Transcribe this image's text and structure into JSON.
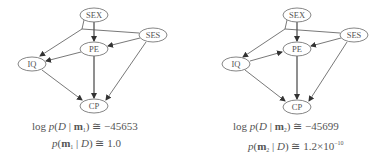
{
  "diagrams": [
    {
      "id": "m1",
      "nodes": {
        "sex": {
          "label": "SEX",
          "cx": 94,
          "cy": 15,
          "rx": 14,
          "ry": 7
        },
        "ses": {
          "label": "SES",
          "cx": 153,
          "cy": 35,
          "rx": 14,
          "ry": 7
        },
        "pe": {
          "label": "PE",
          "cx": 94,
          "cy": 49,
          "rx": 14,
          "ry": 7
        },
        "iq": {
          "label": "IQ",
          "cx": 32,
          "cy": 64,
          "rx": 14,
          "ry": 7
        },
        "cp": {
          "label": "CP",
          "cx": 94,
          "cy": 106,
          "rx": 14,
          "ry": 7
        }
      },
      "edges": [
        {
          "from": "SEX",
          "to": "PE"
        },
        {
          "from": "SES",
          "to": "PE"
        },
        {
          "from": "SEX",
          "to": "IQ"
        },
        {
          "from": "SES",
          "to": "IQ"
        },
        {
          "from": "PE",
          "to": "IQ"
        },
        {
          "from": "IQ",
          "to": "CP"
        },
        {
          "from": "PE",
          "to": "CP"
        },
        {
          "from": "SES",
          "to": "CP"
        }
      ],
      "formula": {
        "log_prefix": "log",
        "p": "p",
        "D": "D",
        "m": "m",
        "subscript": "1",
        "approx": "≅",
        "log_likelihood": "−45653",
        "posterior": "1.0",
        "posterior_exp": ""
      }
    },
    {
      "id": "m2",
      "nodes": {
        "sex": {
          "label": "SEX",
          "cx": 104,
          "cy": 15,
          "rx": 14,
          "ry": 7
        },
        "ses": {
          "label": "SES",
          "cx": 161,
          "cy": 35,
          "rx": 14,
          "ry": 7
        },
        "pe": {
          "label": "PE",
          "cx": 104,
          "cy": 49,
          "rx": 14,
          "ry": 7
        },
        "iq": {
          "label": "IQ",
          "cx": 43,
          "cy": 64,
          "rx": 14,
          "ry": 7
        },
        "cp": {
          "label": "CP",
          "cx": 104,
          "cy": 107,
          "rx": 14,
          "ry": 7
        }
      },
      "edges": [
        {
          "from": "SEX",
          "to": "PE"
        },
        {
          "from": "SES",
          "to": "PE"
        },
        {
          "from": "SEX",
          "to": "IQ"
        },
        {
          "from": "SES",
          "to": "IQ"
        },
        {
          "from": "IQ",
          "to": "PE"
        },
        {
          "from": "IQ",
          "to": "CP"
        },
        {
          "from": "PE",
          "to": "CP"
        },
        {
          "from": "SES",
          "to": "CP"
        }
      ],
      "formula": {
        "log_prefix": "log",
        "p": "p",
        "D": "D",
        "m": "m",
        "subscript": "2",
        "approx": "≅",
        "log_likelihood": "−45699",
        "posterior": "1.2×10",
        "posterior_exp": "−10"
      }
    }
  ]
}
